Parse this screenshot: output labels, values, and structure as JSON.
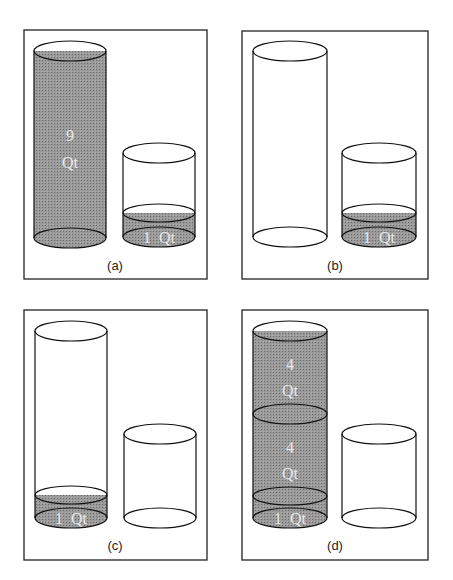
{
  "figure": {
    "colors": {
      "liquid": "#8a8a8a",
      "hatch": "#333333",
      "outline": "#111111",
      "label_text": "#e8e8e8"
    },
    "panels": [
      {
        "id": "a",
        "caption": "(a)",
        "tall_cylinder": {
          "state": "full",
          "labels": [
            "9",
            "Qt"
          ]
        },
        "short_cylinder": {
          "state": "partially filled",
          "labels": [
            "1  Qt"
          ]
        }
      },
      {
        "id": "b",
        "caption": "(b)",
        "tall_cylinder": {
          "state": "empty",
          "labels": []
        },
        "short_cylinder": {
          "state": "partially filled",
          "labels": [
            "1  Qt"
          ]
        }
      },
      {
        "id": "c",
        "caption": "(c)",
        "tall_cylinder": {
          "state": "partially filled",
          "labels": [
            "1  Qt"
          ]
        },
        "short_cylinder": {
          "state": "empty",
          "labels": []
        }
      },
      {
        "id": "d",
        "caption": "(d)",
        "tall_cylinder": {
          "state": "full, layered",
          "labels": [
            "4",
            "Qt",
            "4",
            "Qt",
            "1  Qt"
          ]
        },
        "short_cylinder": {
          "state": "empty",
          "labels": []
        }
      }
    ]
  }
}
